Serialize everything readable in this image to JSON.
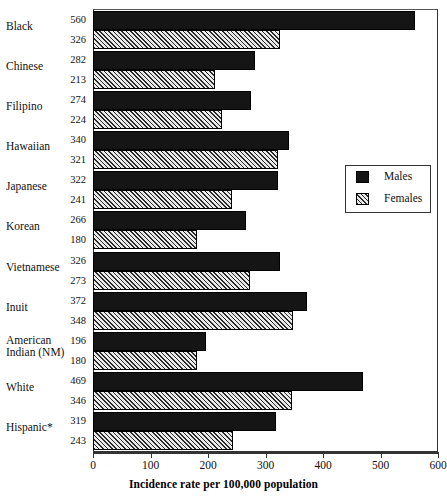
{
  "chart_data": {
    "type": "bar",
    "orientation": "horizontal",
    "title": "",
    "xlabel": "Incidence rate per 100,000 population",
    "ylabel": "",
    "xlim": [
      0,
      600
    ],
    "xticks": [
      0,
      100,
      200,
      300,
      400,
      500,
      600
    ],
    "grid": false,
    "legend_position": "right-middle",
    "categories": [
      "Black",
      "Chinese",
      "Filipino",
      "Hawaiian",
      "Japanese",
      "Korean",
      "Vietnamese",
      "Inuit",
      "American Indian (NM)",
      "White",
      "Hispanic*"
    ],
    "series": [
      {
        "name": "Males",
        "values": [
          560,
          282,
          274,
          340,
          322,
          266,
          326,
          372,
          196,
          469,
          319
        ]
      },
      {
        "name": "Females",
        "values": [
          326,
          213,
          224,
          321,
          241,
          180,
          273,
          348,
          180,
          346,
          243
        ]
      }
    ]
  },
  "category_labels": [
    {
      "line1": "Black",
      "line2": ""
    },
    {
      "line1": "Chinese",
      "line2": ""
    },
    {
      "line1": "Filipino",
      "line2": ""
    },
    {
      "line1": "Hawaiian",
      "line2": ""
    },
    {
      "line1": "Japanese",
      "line2": ""
    },
    {
      "line1": "Korean",
      "line2": ""
    },
    {
      "line1": "Vietnamese",
      "line2": ""
    },
    {
      "line1": "Inuit",
      "line2": ""
    },
    {
      "line1": "American",
      "line2": "Indian (NM)"
    },
    {
      "line1": "White",
      "line2": ""
    },
    {
      "line1": "Hispanic*",
      "line2": ""
    }
  ],
  "value_labels": {
    "males": [
      "560",
      "282",
      "274",
      "340",
      "322",
      "266",
      "326",
      "372",
      "196",
      "469",
      "319"
    ],
    "females": [
      "326",
      "213",
      "224",
      "321",
      "241",
      "180",
      "273",
      "348",
      "180",
      "346",
      "243"
    ]
  },
  "axis": {
    "tick_labels": [
      "0",
      "100",
      "200",
      "300",
      "400",
      "500",
      "600"
    ],
    "title": "Incidence rate per 100,000 population"
  },
  "legend": {
    "males_label": "Males",
    "females_label": "Females"
  },
  "colors": {
    "males_fill": "#151515",
    "females_fill": "#e9e9e9",
    "females_hatch": "#2a2a2a",
    "frame": "#333333",
    "text": "#111111",
    "background": "#ffffff"
  }
}
